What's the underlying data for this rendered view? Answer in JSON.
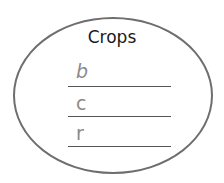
{
  "diagram": {
    "title": "Crops",
    "entries": [
      {
        "letter": "b",
        "style": "italic"
      },
      {
        "letter": "c",
        "style": "normal"
      },
      {
        "letter": "r",
        "style": "normal"
      }
    ],
    "colors": {
      "outline": "#6e6e6e",
      "title": "#1a1a1a",
      "letter": "#8a8a8a",
      "line": "#555555"
    }
  }
}
